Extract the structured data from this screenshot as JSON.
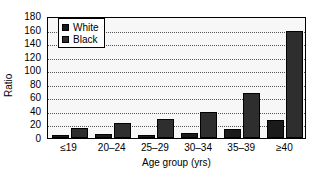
{
  "chart_data": {
    "type": "bar",
    "title": "",
    "subtitle": "",
    "xlabel": "Age group (yrs)",
    "ylabel": "Ratio",
    "categories": [
      "≤19",
      "20–24",
      "25–29",
      "30–34",
      "35–39",
      "≥40"
    ],
    "series": [
      {
        "name": "White",
        "color": "#1a1a1a",
        "values": [
          5,
          6,
          5,
          8,
          13,
          27
        ]
      },
      {
        "name": "Black",
        "color": "#2e2e2e",
        "values": [
          15,
          22,
          28,
          38,
          67,
          158
        ]
      }
    ],
    "ylim": [
      0,
      180
    ],
    "ytick_values": [
      0,
      20,
      40,
      60,
      80,
      100,
      120,
      140,
      160,
      180
    ],
    "ytick_labels": [
      "0",
      "20",
      "40",
      "60",
      "80",
      "100",
      "120",
      "140",
      "160",
      "180"
    ],
    "grid": true,
    "grid_style": "dotted",
    "grid_axis": "y",
    "legend_position": "upper-left",
    "legend_entries": [
      "White",
      "Black"
    ],
    "plot_background": "#f7f7f7",
    "frame_color": "#000000"
  }
}
